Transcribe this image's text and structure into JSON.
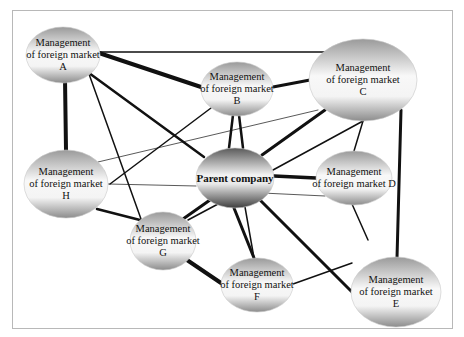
{
  "diagram": {
    "type": "network",
    "nodes": [
      {
        "id": "A",
        "label": "Management\nof foreign market\nA",
        "cx": 63,
        "cy": 55,
        "rx": 37,
        "ry": 28
      },
      {
        "id": "B",
        "label": "Management\nof foreign market\nB",
        "cx": 237,
        "cy": 89,
        "rx": 36,
        "ry": 27
      },
      {
        "id": "C",
        "label": "Management\nof foreign market\nC",
        "cx": 363,
        "cy": 80,
        "rx": 54,
        "ry": 41
      },
      {
        "id": "P",
        "label": "Parent company",
        "cx": 235,
        "cy": 178,
        "rx": 39,
        "ry": 30
      },
      {
        "id": "D",
        "label": "Management\nof foreign market D",
        "cx": 354,
        "cy": 178,
        "rx": 38,
        "ry": 27
      },
      {
        "id": "H",
        "label": "Management\nof foreign market\nH",
        "cx": 66,
        "cy": 184,
        "rx": 42,
        "ry": 34
      },
      {
        "id": "G",
        "label": "Management\nof foreign market\nG",
        "cx": 163,
        "cy": 241,
        "rx": 33,
        "ry": 29
      },
      {
        "id": "F",
        "label": "Management\nof foreign market\nF",
        "cx": 257,
        "cy": 285,
        "rx": 36,
        "ry": 27
      },
      {
        "id": "E",
        "label": "Management\nof foreign market\nE",
        "cx": 396,
        "cy": 292,
        "rx": 45,
        "ry": 35
      }
    ],
    "edges": [
      {
        "from": "A",
        "to": "C",
        "width": 1.5,
        "x1": 100,
        "y1": 52,
        "x2": 325,
        "y2": 52
      },
      {
        "from": "A",
        "to": "B",
        "width": 4,
        "x1": 99,
        "y1": 53,
        "x2": 201,
        "y2": 87
      },
      {
        "from": "A",
        "to": "H",
        "width": 4,
        "x1": 65,
        "y1": 79,
        "x2": 66,
        "y2": 150
      },
      {
        "from": "A",
        "to": "P",
        "width": 2.5,
        "x1": 89,
        "y1": 73,
        "x2": 204,
        "y2": 157
      },
      {
        "from": "A",
        "to": "G",
        "width": 1.5,
        "x1": 89,
        "y1": 74,
        "x2": 141,
        "y2": 219
      },
      {
        "from": "B",
        "to": "C",
        "width": 3,
        "x1": 273,
        "y1": 87,
        "x2": 310,
        "y2": 80
      },
      {
        "from": "B",
        "to": "P",
        "width": 2.5,
        "x1": 233,
        "y1": 115,
        "x2": 229,
        "y2": 148
      },
      {
        "from": "B",
        "to": "P",
        "width": 2.5,
        "x1": 239,
        "y1": 115,
        "x2": 243,
        "y2": 148
      },
      {
        "from": "B",
        "to": "H",
        "width": 1.5,
        "x1": 211,
        "y1": 108,
        "x2": 110,
        "y2": 184
      },
      {
        "from": "C",
        "to": "H",
        "width": 0.7,
        "x1": 318,
        "y1": 110,
        "x2": 98,
        "y2": 162
      },
      {
        "from": "C",
        "to": "P",
        "width": 3,
        "x1": 325,
        "y1": 110,
        "x2": 262,
        "y2": 155
      },
      {
        "from": "C",
        "to": "P",
        "width": 1.5,
        "x1": 363,
        "y1": 121,
        "x2": 273,
        "y2": 170
      },
      {
        "from": "C",
        "to": "D",
        "width": 1.5,
        "x1": 363,
        "y1": 121,
        "x2": 354,
        "y2": 151
      },
      {
        "from": "C",
        "to": "E",
        "width": 3,
        "x1": 401,
        "y1": 110,
        "x2": 397,
        "y2": 258
      },
      {
        "from": "P",
        "to": "D",
        "width": 3.5,
        "x1": 274,
        "y1": 176,
        "x2": 316,
        "y2": 178
      },
      {
        "from": "P",
        "to": "H",
        "width": 0.7,
        "x1": 196,
        "y1": 186,
        "x2": 108,
        "y2": 184
      },
      {
        "from": "P",
        "to": "D",
        "width": 0.7,
        "x1": 262,
        "y1": 193,
        "x2": 325,
        "y2": 196
      },
      {
        "from": "P",
        "to": "G",
        "width": 3,
        "x1": 210,
        "y1": 200,
        "x2": 183,
        "y2": 219
      },
      {
        "from": "P",
        "to": "G",
        "width": 1.5,
        "x1": 218,
        "y1": 204,
        "x2": 188,
        "y2": 220
      },
      {
        "from": "P",
        "to": "F",
        "width": 3,
        "x1": 234,
        "y1": 208,
        "x2": 254,
        "y2": 258
      },
      {
        "from": "P",
        "to": "F",
        "width": 1.5,
        "x1": 245,
        "y1": 207,
        "x2": 254,
        "y2": 258
      },
      {
        "from": "P",
        "to": "E",
        "width": 3,
        "x1": 260,
        "y1": 200,
        "x2": 352,
        "y2": 292
      },
      {
        "from": "H",
        "to": "G",
        "width": 2.5,
        "x1": 97,
        "y1": 209,
        "x2": 140,
        "y2": 220
      },
      {
        "from": "G",
        "to": "F",
        "width": 4,
        "x1": 187,
        "y1": 260,
        "x2": 221,
        "y2": 283
      },
      {
        "from": "D",
        "to": "E",
        "width": 1.5,
        "x1": 352,
        "y1": 204,
        "x2": 368,
        "y2": 240
      },
      {
        "from": "F",
        "to": "E",
        "width": 1.5,
        "x1": 293,
        "y1": 284,
        "x2": 352,
        "y2": 263
      }
    ],
    "colors": {
      "edge": "#111111",
      "frame": "#b8b8b8",
      "node_light": "#f7f7f7",
      "node_dark": "#8e8e8e",
      "parent_dark": "#4a4a4a"
    }
  }
}
